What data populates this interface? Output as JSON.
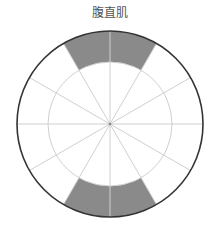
{
  "diagram": {
    "title": "腹直肌",
    "center": [
      110,
      124
    ],
    "outer_radius": 93,
    "inner_radius": 62,
    "spoke_count": 12,
    "colors": {
      "background": "#ffffff",
      "outer_ring": "#333333",
      "grid": "#d0d0d0",
      "highlight": "#8a8a8a",
      "title": "#555555"
    },
    "highlighted_segments": [
      {
        "name": "top",
        "start_angle_deg": -120,
        "end_angle_deg": -60
      },
      {
        "name": "bottom",
        "start_angle_deg": 60,
        "end_angle_deg": 120
      }
    ]
  }
}
